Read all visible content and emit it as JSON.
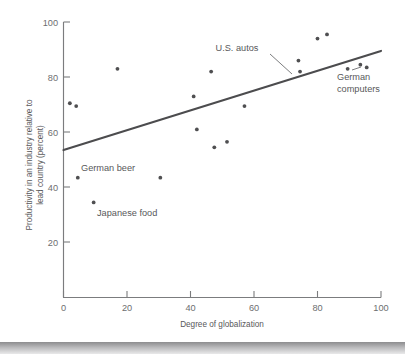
{
  "chart_data": {
    "type": "scatter",
    "title": "",
    "xlabel": "Degree of globalization",
    "ylabel": "Productivity in an industry relative to lead country (percent)",
    "xlim": [
      0,
      100
    ],
    "ylim": [
      0,
      100
    ],
    "xticks": [
      0,
      20,
      40,
      60,
      80,
      100
    ],
    "yticks": [
      20,
      40,
      60,
      80,
      100
    ],
    "xticklabels": [
      "0",
      "20",
      "40",
      "60",
      "80",
      "100"
    ],
    "yticklabels": [
      "20",
      "40",
      "60",
      "80",
      "100"
    ],
    "grid": false,
    "legend": "none",
    "points": [
      {
        "x": 2.0,
        "y": 70.5
      },
      {
        "x": 4.0,
        "y": 69.5
      },
      {
        "x": 4.5,
        "y": 43.5
      },
      {
        "x": 9.5,
        "y": 34.5
      },
      {
        "x": 17.0,
        "y": 83.0
      },
      {
        "x": 30.5,
        "y": 43.5
      },
      {
        "x": 41.0,
        "y": 73.0
      },
      {
        "x": 42.0,
        "y": 61.0
      },
      {
        "x": 46.5,
        "y": 82.0
      },
      {
        "x": 47.5,
        "y": 54.5
      },
      {
        "x": 51.5,
        "y": 56.5
      },
      {
        "x": 57.0,
        "y": 69.5
      },
      {
        "x": 74.0,
        "y": 86.0
      },
      {
        "x": 74.5,
        "y": 82.0
      },
      {
        "x": 80.0,
        "y": 94.0
      },
      {
        "x": 83.0,
        "y": 95.5
      },
      {
        "x": 89.5,
        "y": 83.0
      },
      {
        "x": 93.5,
        "y": 84.5
      },
      {
        "x": 95.5,
        "y": 83.5
      }
    ],
    "trend_line": {
      "x0": 0,
      "y0": 53.5,
      "x1": 100,
      "y1": 89.5
    },
    "annotations": [
      {
        "label": "U.S. autos",
        "label_x": 237,
        "label_y": 51,
        "anchor": "middle",
        "leader": [
          [
            268,
            55
          ],
          [
            289,
            75
          ]
        ]
      },
      {
        "label_lines": [
          "German",
          "computers"
        ],
        "label_x": 337,
        "label_y": 80,
        "anchor": "start",
        "leader": [
          [
            354,
            72
          ],
          [
            366,
            59
          ]
        ]
      },
      {
        "label": "German beer",
        "label_x": 81,
        "label_y": 171,
        "anchor": "start",
        "leader": null
      },
      {
        "label": "Japanese food",
        "label_x": 88,
        "label_y": 216,
        "anchor": "start",
        "leader": null
      }
    ]
  },
  "figure": {
    "x_axis_label": "Degree of globalization",
    "y_axis_label_line1": "Productivity in an industry relative to",
    "y_axis_label_line2": "lead country (percent)",
    "tick_100": "100",
    "tick_80": "80",
    "tick_60": "60",
    "tick_40": "40",
    "tick_20": "20",
    "tick_x0": "0",
    "tick_x20": "20",
    "tick_x40": "40",
    "tick_x60": "60",
    "tick_x80": "80",
    "tick_x100": "100",
    "annot_us_autos": "U.S. autos",
    "annot_german_computers_1": "German",
    "annot_german_computers_2": "computers",
    "annot_german_beer": "German beer",
    "annot_japanese_food": "Japanese food"
  },
  "colors": {
    "point": "#4f4f51",
    "trend": "#4c4c4e",
    "axis": "#7b7c7e",
    "text": "#58585a",
    "background": "#ffffff"
  }
}
